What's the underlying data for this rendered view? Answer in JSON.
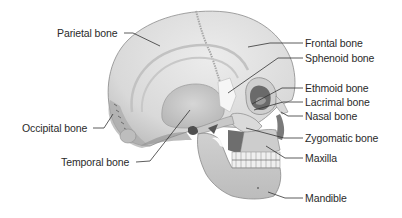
{
  "diagram": {
    "labels": {
      "parietal": "Parietal bone",
      "frontal": "Frontal bone",
      "sphenoid": "Sphenoid bone",
      "ethmoid": "Ethmoid bone",
      "lacrimal": "Lacrimal bone",
      "nasal": "Nasal bone",
      "zygomatic": "Zygomatic bone",
      "maxilla": "Maxilla",
      "mandible": "Mandible",
      "occipital": "Occipital bone",
      "temporal": "Temporal bone"
    },
    "colors": {
      "bone_light": "#e6e6e6",
      "bone_mid": "#cfcfcf",
      "bone_shadow": "#9a9a9a",
      "dark_cavity": "#5a5a5a",
      "leader_line": "#333333",
      "text": "#2a2a2a"
    }
  }
}
